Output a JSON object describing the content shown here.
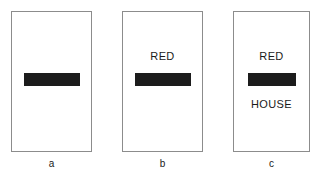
{
  "figure": {
    "background_color": "#ffffff",
    "panel_border_color": "#8c8c8c",
    "occluder_color": "#1c1c1c",
    "text_color": "#1a1a1a",
    "panels": [
      {
        "caption": "a",
        "word_top": "",
        "word_bottom": "",
        "occluder": "black-bar",
        "has_word_top": false,
        "has_word_bottom": false
      },
      {
        "caption": "b",
        "word_top": "RED",
        "word_bottom": "",
        "occluder": "black-bar",
        "has_word_top": true,
        "has_word_bottom": false
      },
      {
        "caption": "c",
        "word_top": "RED",
        "word_bottom": "HOUSE",
        "occluder": "black-bar",
        "has_word_top": true,
        "has_word_bottom": true
      }
    ]
  }
}
